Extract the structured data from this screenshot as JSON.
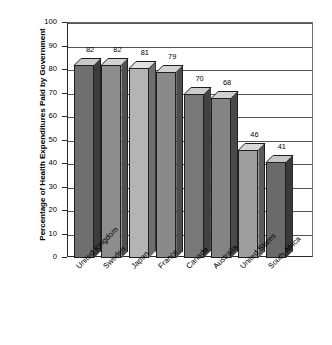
{
  "chart_data": {
    "type": "bar",
    "title": "",
    "xlabel": "",
    "ylabel": "Percentage of Health Expenditures Paid by Government",
    "ylim": [
      0,
      100
    ],
    "ytick_step": 10,
    "yticks": [
      "100",
      "90",
      "80",
      "70",
      "60",
      "50",
      "40",
      "30",
      "20",
      "10",
      "0"
    ],
    "grid": true,
    "legend": "none",
    "style": "3d-bar-grayscale",
    "categories": [
      "United Kingdom",
      "Sweden",
      "Japan",
      "France",
      "Canada",
      "Australia",
      "United States",
      "South Africa"
    ],
    "values": [
      82,
      82,
      81,
      79,
      70,
      68,
      46,
      41
    ],
    "value_labels": [
      "82",
      "82",
      "81",
      "79",
      "70",
      "68",
      "46",
      "41"
    ],
    "bar_colors": [
      "#6f6f6f",
      "#8d8d8d",
      "#b4b4b4",
      "#8a8a8a",
      "#787878",
      "#848484",
      "#9e9e9e",
      "#6a6a6a"
    ],
    "bar_top_colors": [
      "#c9c9c9",
      "#d3d3d3",
      "#e0e0e0",
      "#d2d2d2",
      "#cccccc",
      "#d0d0d0",
      "#d8d8d8",
      "#c6c6c6"
    ],
    "bar_side_colors": [
      "#3c3c3c",
      "#4f4f4f",
      "#6d6d6d",
      "#4d4d4d",
      "#414141",
      "#494949",
      "#5c5c5c",
      "#3a3a3a"
    ],
    "axis_color": "#2a2a2a",
    "gridline_color": "#555555",
    "background_color": "#ffffff"
  }
}
